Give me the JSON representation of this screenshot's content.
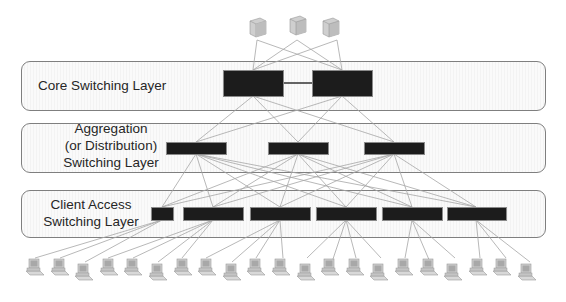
{
  "diagram": {
    "layers": [
      {
        "id": "core",
        "label": "Core Switching Layer"
      },
      {
        "id": "aggregation",
        "label_lines": [
          "Aggregation",
          "(or Distribution)",
          "Switching Layer"
        ]
      },
      {
        "id": "access",
        "label_lines": [
          "Client Access",
          "Switching Layer"
        ]
      }
    ],
    "node_counts": {
      "servers": 3,
      "core_switches": 2,
      "aggregation_switches": 3,
      "access_switches": 6,
      "client_computers": 21
    },
    "icons": {
      "server": "server-icon",
      "switch": "switch-icon",
      "client": "desktop-computer-icon"
    },
    "colors": {
      "switch_fill": "#1c1c1c",
      "box_border": "#7f7f7f",
      "link_line": "#a6a6a6",
      "text": "#262626"
    }
  }
}
